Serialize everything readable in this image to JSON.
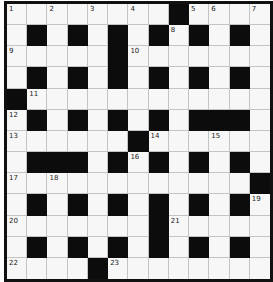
{
  "puzzle": {
    "rows": 13,
    "cols": 13,
    "colors": {
      "white_cell": "#f7f7f7",
      "black_cell": "#0c0c0c",
      "grid_line": "#c4c4c4",
      "border": "#111111"
    },
    "black_cells": [
      [
        8
      ],
      [
        1,
        3,
        5,
        7,
        9,
        11
      ],
      [
        5
      ],
      [
        1,
        3,
        5,
        7,
        9,
        11
      ],
      [
        0
      ],
      [
        1,
        3,
        5,
        7,
        9,
        10,
        11
      ],
      [
        6
      ],
      [
        1,
        2,
        3,
        5,
        7,
        9,
        11
      ],
      [
        12
      ],
      [
        1,
        3,
        5,
        7,
        9,
        11
      ],
      [
        7
      ],
      [
        1,
        3,
        5,
        7,
        9,
        11
      ],
      [
        4
      ]
    ],
    "numbers": [
      {
        "row": 0,
        "col": 0,
        "n": "1"
      },
      {
        "row": 0,
        "col": 2,
        "n": "2"
      },
      {
        "row": 0,
        "col": 4,
        "n": "3"
      },
      {
        "row": 0,
        "col": 6,
        "n": "4"
      },
      {
        "row": 0,
        "col": 9,
        "n": "5"
      },
      {
        "row": 0,
        "col": 10,
        "n": "6"
      },
      {
        "row": 0,
        "col": 12,
        "n": "7"
      },
      {
        "row": 1,
        "col": 8,
        "n": "8"
      },
      {
        "row": 2,
        "col": 0,
        "n": "9"
      },
      {
        "row": 2,
        "col": 6,
        "n": "10"
      },
      {
        "row": 4,
        "col": 1,
        "n": "11"
      },
      {
        "row": 5,
        "col": 0,
        "n": "12"
      },
      {
        "row": 6,
        "col": 0,
        "n": "13"
      },
      {
        "row": 6,
        "col": 7,
        "n": "14"
      },
      {
        "row": 6,
        "col": 10,
        "n": "15"
      },
      {
        "row": 7,
        "col": 6,
        "n": "16"
      },
      {
        "row": 8,
        "col": 0,
        "n": "17"
      },
      {
        "row": 8,
        "col": 2,
        "n": "18"
      },
      {
        "row": 9,
        "col": 12,
        "n": "19"
      },
      {
        "row": 10,
        "col": 0,
        "n": "20"
      },
      {
        "row": 10,
        "col": 8,
        "n": "21"
      },
      {
        "row": 12,
        "col": 0,
        "n": "22"
      },
      {
        "row": 12,
        "col": 5,
        "n": "23"
      }
    ]
  }
}
